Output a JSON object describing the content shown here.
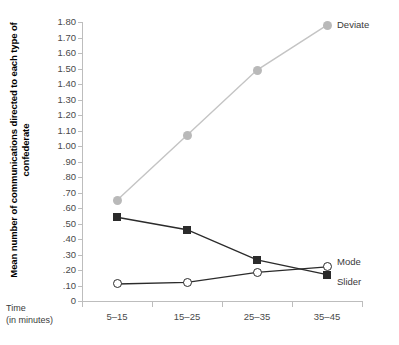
{
  "chart_data": {
    "type": "line",
    "title": "",
    "xlabel": "Time (in minutes)",
    "ylabel": "Mean number of communications directed to each type of confederate",
    "ylabel_line1": "Mean number of communications directed to",
    "ylabel_line2": "each type of confederate",
    "xlabel_line1": "Time",
    "xlabel_line2": "(in minutes)",
    "categories": [
      "5–15",
      "15–25",
      "25–35",
      "35–45"
    ],
    "ylim": [
      0,
      1.8
    ],
    "ytick_labels": [
      "1.80",
      "1.70",
      "1.60",
      "1.50",
      "1.40",
      "1.30",
      "1.20",
      "1.10",
      "1.00",
      ".90",
      ".80",
      ".70",
      ".60",
      ".50",
      ".40",
      ".30",
      ".20",
      ".10",
      "0"
    ],
    "ytick_values": [
      1.8,
      1.7,
      1.6,
      1.5,
      1.4,
      1.3,
      1.2,
      1.1,
      1.0,
      0.9,
      0.8,
      0.7,
      0.6,
      0.5,
      0.4,
      0.3,
      0.2,
      0.1,
      0
    ],
    "grid": false,
    "legend_position": "right-of-line-ends",
    "series": [
      {
        "name": "Deviate",
        "values": [
          0.65,
          1.07,
          1.49,
          1.78
        ],
        "marker": "circle-filled",
        "color": "#b9b9b9",
        "line_color": "#c4c4c4"
      },
      {
        "name": "Slider",
        "values": [
          0.54,
          0.46,
          0.265,
          0.17
        ],
        "marker": "square-filled",
        "color": "#2b2b2b",
        "line_color": "#2b2b2b"
      },
      {
        "name": "Mode",
        "values": [
          0.11,
          0.12,
          0.185,
          0.22
        ],
        "marker": "circle-open",
        "color": "#2b2b2b",
        "line_color": "#2b2b2b"
      }
    ]
  },
  "labels": {
    "deviate": "Deviate",
    "mode": "Mode",
    "slider": "Slider"
  }
}
